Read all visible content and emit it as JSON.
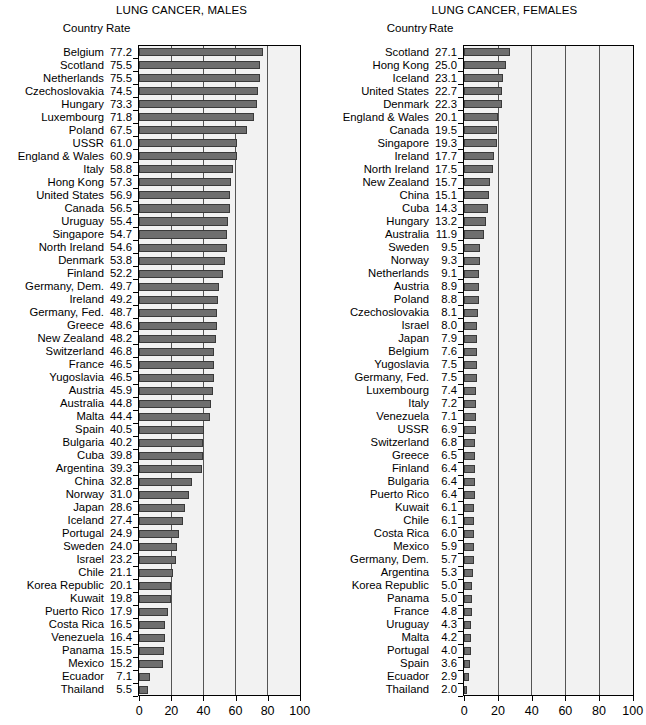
{
  "chart_data": [
    {
      "type": "bar",
      "orientation": "horizontal",
      "title": "LUNG CANCER, MALES",
      "xlabel": "",
      "ylabel": "",
      "xlim": [
        0,
        100
      ],
      "xticks": [
        0,
        20,
        40,
        60,
        80,
        100
      ],
      "grid": true,
      "grid_axis": "x",
      "legend": null,
      "column_headers": {
        "country": "Country",
        "rate": "Rate"
      },
      "categories": [
        "Belgium",
        "Scotland",
        "Netherlands",
        "Czechoslovakia",
        "Hungary",
        "Luxembourg",
        "Poland",
        "USSR",
        "England & Wales",
        "Italy",
        "Hong Kong",
        "United States",
        "Canada",
        "Uruguay",
        "Singapore",
        "North Ireland",
        "Denmark",
        "Finland",
        "Germany, Dem.",
        "Ireland",
        "Germany, Fed.",
        "Greece",
        "New Zealand",
        "Switzerland",
        "France",
        "Yugoslavia",
        "Austria",
        "Australia",
        "Malta",
        "Spain",
        "Bulgaria",
        "Cuba",
        "Argentina",
        "China",
        "Norway",
        "Japan",
        "Iceland",
        "Portugal",
        "Sweden",
        "Israel",
        "Chile",
        "Korea Republic",
        "Kuwait",
        "Puerto Rico",
        "Costa Rica",
        "Venezuela",
        "Panama",
        "Mexico",
        "Ecuador",
        "Thailand"
      ],
      "values": [
        77.2,
        75.5,
        75.5,
        74.5,
        73.3,
        71.8,
        67.5,
        61.0,
        60.9,
        58.8,
        57.3,
        56.9,
        56.5,
        55.4,
        54.7,
        54.6,
        53.8,
        52.2,
        49.7,
        49.2,
        48.7,
        48.6,
        48.2,
        46.8,
        46.5,
        46.5,
        45.9,
        44.8,
        44.4,
        40.5,
        40.2,
        39.8,
        39.3,
        32.8,
        31.0,
        28.6,
        27.4,
        24.9,
        24.0,
        23.2,
        21.1,
        20.1,
        19.8,
        17.9,
        16.5,
        16.4,
        15.5,
        15.2,
        7.1,
        5.5
      ],
      "value_labels": [
        "77.2",
        "75.5",
        "75.5",
        "74.5",
        "73.3",
        "71.8",
        "67.5",
        "61.0",
        "60.9",
        "58.8",
        "57.3",
        "56.9",
        "56.5",
        "55.4",
        "54.7",
        "54.6",
        "53.8",
        "52.2",
        "49.7",
        "49.2",
        "48.7",
        "48.6",
        "48.2",
        "46.8",
        "46.5",
        "46.5",
        "45.9",
        "44.8",
        "44.4",
        "40.5",
        "40.2",
        "39.8",
        "39.3",
        "32.8",
        "31.0",
        "28.6",
        "27.4",
        "24.9",
        "24.0",
        "23.2",
        "21.1",
        "20.1",
        "19.8",
        "17.9",
        "16.5",
        "16.4",
        "15.5",
        "15.2",
        "7.1",
        "5.5"
      ],
      "xtick_labels": [
        "0",
        "20",
        "40",
        "60",
        "80",
        "100"
      ]
    },
    {
      "type": "bar",
      "orientation": "horizontal",
      "title": "LUNG CANCER, FEMALES",
      "xlabel": "",
      "ylabel": "",
      "xlim": [
        0,
        100
      ],
      "xticks": [
        0,
        20,
        40,
        60,
        80,
        100
      ],
      "grid": true,
      "grid_axis": "x",
      "legend": null,
      "column_headers": {
        "country": "Country",
        "rate": "Rate"
      },
      "categories": [
        "Scotland",
        "Hong Kong",
        "Iceland",
        "United States",
        "Denmark",
        "England & Wales",
        "Canada",
        "Singapore",
        "Ireland",
        "North Ireland",
        "New Zealand",
        "China",
        "Cuba",
        "Hungary",
        "Australia",
        "Sweden",
        "Norway",
        "Netherlands",
        "Austria",
        "Poland",
        "Czechoslovakia",
        "Israel",
        "Japan",
        "Belgium",
        "Yugoslavia",
        "Germany, Fed.",
        "Luxembourg",
        "Italy",
        "Venezuela",
        "USSR",
        "Switzerland",
        "Greece",
        "Finland",
        "Bulgaria",
        "Puerto Rico",
        "Kuwait",
        "Chile",
        "Costa Rica",
        "Mexico",
        "Germany, Dem.",
        "Argentina",
        "Korea Republic",
        "Panama",
        "France",
        "Uruguay",
        "Malta",
        "Portugal",
        "Spain",
        "Ecuador",
        "Thailand"
      ],
      "values": [
        27.1,
        25.0,
        23.1,
        22.7,
        22.3,
        20.1,
        19.5,
        19.3,
        17.7,
        17.5,
        15.7,
        15.1,
        14.3,
        13.2,
        11.9,
        9.5,
        9.3,
        9.1,
        8.9,
        8.8,
        8.1,
        8.0,
        7.9,
        7.6,
        7.5,
        7.5,
        7.4,
        7.2,
        7.1,
        6.9,
        6.8,
        6.5,
        6.4,
        6.4,
        6.4,
        6.1,
        6.1,
        6.0,
        5.9,
        5.7,
        5.3,
        5.0,
        5.0,
        4.8,
        4.3,
        4.2,
        4.0,
        3.6,
        2.9,
        2.0
      ],
      "value_labels": [
        "27.1",
        "25.0",
        "23.1",
        "22.7",
        "22.3",
        "20.1",
        "19.5",
        "19.3",
        "17.7",
        "17.5",
        "15.7",
        "15.1",
        "14.3",
        "13.2",
        "11.9",
        "9.5",
        "9.3",
        "9.1",
        "8.9",
        "8.8",
        "8.1",
        "8.0",
        "7.9",
        "7.6",
        "7.5",
        "7.5",
        "7.4",
        "7.2",
        "7.1",
        "6.9",
        "6.8",
        "6.5",
        "6.4",
        "6.4",
        "6.4",
        "6.1",
        "6.1",
        "6.0",
        "5.9",
        "5.7",
        "5.3",
        "5.0",
        "5.0",
        "4.8",
        "4.3",
        "4.2",
        "4.0",
        "3.6",
        "2.9",
        "2.0"
      ],
      "xtick_labels": [
        "0",
        "20",
        "40",
        "60",
        "80",
        "100"
      ]
    }
  ],
  "style": {
    "bar_fill": "#6e6e6e",
    "bar_border": "#3a3a3a",
    "plot_background": "#f2f2f2",
    "axis_color": "#000000",
    "grid_color": "#555555",
    "text_color": "#000000"
  }
}
